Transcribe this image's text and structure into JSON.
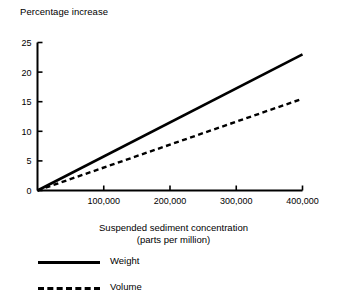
{
  "chart_data": {
    "type": "line",
    "title": "",
    "ylabel": "Percentage increase",
    "xlabel_line1": "Suspended sediment concentration",
    "xlabel_line2": "(parts per million)",
    "xlim": [
      0,
      400000
    ],
    "ylim": [
      0,
      25
    ],
    "grid": false,
    "legend_position": "below-left",
    "x_ticks": [
      100000,
      200000,
      300000,
      400000
    ],
    "x_tick_labels": [
      "100,000",
      "200,000",
      "300,000",
      "400,000"
    ],
    "y_ticks": [
      0,
      5,
      10,
      15,
      20,
      25
    ],
    "y_tick_labels": [
      "0",
      "5",
      "10",
      "15",
      "20",
      "25"
    ],
    "series": [
      {
        "name": "Weight",
        "style": "solid",
        "color": "#000000",
        "x": [
          0,
          400000
        ],
        "values": [
          0,
          23
        ]
      },
      {
        "name": "Volume",
        "style": "dashed",
        "color": "#000000",
        "x": [
          0,
          400000
        ],
        "values": [
          0,
          15.5
        ]
      }
    ]
  },
  "legend": {
    "items": [
      {
        "label": "Weight",
        "style": "solid"
      },
      {
        "label": "Volume",
        "style": "dashed"
      }
    ]
  }
}
